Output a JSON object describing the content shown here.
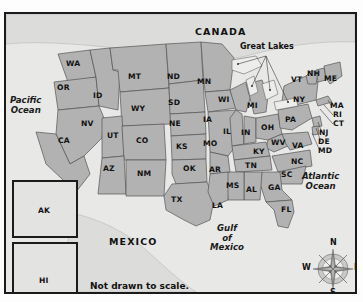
{
  "figure": {
    "note": "Not drawn to scale.",
    "background_color": "#e8e8e6",
    "land_fill_color": "#b2b2b2",
    "water_fill_color": "#ededeb",
    "border_color": "#1b1b1b",
    "outline_color": "#4a4a4a"
  },
  "countries": [
    {
      "name": "CANADA",
      "x": 199,
      "y": 22
    },
    {
      "name": "MEXICO",
      "x": 113,
      "y": 232
    }
  ],
  "oceans": [
    {
      "name": "Pacific\nOcean",
      "line1": "Pacific",
      "line2": "Ocean",
      "x": 8,
      "y": 92
    },
    {
      "name": "Atlantic\nOcean",
      "line1": "Atlantic",
      "line2": "Ocean",
      "x": 305,
      "y": 168
    }
  ],
  "gulf": {
    "line1": "Gulf",
    "line2": "of",
    "line3": "Mexico",
    "x": 212,
    "y": 222
  },
  "callouts": [
    {
      "label": "Great Lakes",
      "x": 241,
      "y": 38
    }
  ],
  "compass": {
    "north": "N",
    "south": "S",
    "east": "E",
    "west": "W",
    "center_x": 327,
    "center_y": 259
  },
  "insets": [
    {
      "label": "AK",
      "x": 7,
      "y": 175,
      "w": 64,
      "h": 56
    },
    {
      "label": "HI",
      "x": 7,
      "y": 235,
      "w": 64,
      "h": 52
    }
  ],
  "states": [
    {
      "code": "WA",
      "name": "Washington",
      "x": 66,
      "y": 50
    },
    {
      "code": "OR",
      "name": "Oregon",
      "x": 57,
      "y": 74
    },
    {
      "code": "ID",
      "name": "Idaho",
      "x": 93,
      "y": 82
    },
    {
      "code": "MT",
      "name": "Montana",
      "x": 128,
      "y": 63
    },
    {
      "code": "ND",
      "name": "North Dakota",
      "x": 167,
      "y": 63
    },
    {
      "code": "MN",
      "name": "Minnesota",
      "x": 197,
      "y": 68
    },
    {
      "code": "WI",
      "name": "Wisconsin",
      "x": 218,
      "y": 86
    },
    {
      "code": "MI",
      "name": "Michigan",
      "x": 247,
      "y": 92
    },
    {
      "code": "SD",
      "name": "South Dakota",
      "x": 168,
      "y": 89
    },
    {
      "code": "WY",
      "name": "Wyoming",
      "x": 131,
      "y": 95
    },
    {
      "code": "NV",
      "name": "Nevada",
      "x": 81,
      "y": 110
    },
    {
      "code": "CA",
      "name": "California",
      "x": 58,
      "y": 127
    },
    {
      "code": "UT",
      "name": "Utah",
      "x": 107,
      "y": 122
    },
    {
      "code": "CO",
      "name": "Colorado",
      "x": 136,
      "y": 127
    },
    {
      "code": "NE",
      "name": "Nebraska",
      "x": 169,
      "y": 110
    },
    {
      "code": "IA",
      "name": "Iowa",
      "x": 203,
      "y": 106
    },
    {
      "code": "IL",
      "name": "Illinois",
      "x": 223,
      "y": 118
    },
    {
      "code": "IN",
      "name": "Indiana",
      "x": 241,
      "y": 119
    },
    {
      "code": "OH",
      "name": "Ohio",
      "x": 261,
      "y": 114
    },
    {
      "code": "PA",
      "name": "Pennsylvania",
      "x": 285,
      "y": 106
    },
    {
      "code": "NY",
      "name": "New York",
      "x": 293,
      "y": 86
    },
    {
      "code": "VT",
      "name": "Vermont",
      "x": 291,
      "y": 66
    },
    {
      "code": "NH",
      "name": "New Hampshire",
      "x": 307,
      "y": 60
    },
    {
      "code": "ME",
      "name": "Maine",
      "x": 324,
      "y": 65
    },
    {
      "code": "MA",
      "name": "Massachusetts",
      "x": 330,
      "y": 92
    },
    {
      "code": "RI",
      "name": "Rhode Island",
      "x": 333,
      "y": 101
    },
    {
      "code": "CT",
      "name": "Connecticut",
      "x": 333,
      "y": 110
    },
    {
      "code": "NJ",
      "name": "New Jersey",
      "x": 319,
      "y": 119
    },
    {
      "code": "DE",
      "name": "Delaware",
      "x": 318,
      "y": 128
    },
    {
      "code": "MD",
      "name": "Maryland",
      "x": 318,
      "y": 137
    },
    {
      "code": "WV",
      "name": "West Virginia",
      "x": 271,
      "y": 129
    },
    {
      "code": "VA",
      "name": "Virginia",
      "x": 292,
      "y": 132
    },
    {
      "code": "KY",
      "name": "Kentucky",
      "x": 253,
      "y": 138
    },
    {
      "code": "NC",
      "name": "North Carolina",
      "x": 291,
      "y": 148
    },
    {
      "code": "TN",
      "name": "Tennessee",
      "x": 245,
      "y": 152
    },
    {
      "code": "SC",
      "name": "South Carolina",
      "x": 281,
      "y": 161
    },
    {
      "code": "GA",
      "name": "Georgia",
      "x": 268,
      "y": 174
    },
    {
      "code": "AL",
      "name": "Alabama",
      "x": 246,
      "y": 176
    },
    {
      "code": "MS",
      "name": "Mississippi",
      "x": 226,
      "y": 172
    },
    {
      "code": "AR",
      "name": "Arkansas",
      "x": 209,
      "y": 156
    },
    {
      "code": "MO",
      "name": "Missouri",
      "x": 203,
      "y": 130
    },
    {
      "code": "KS",
      "name": "Kansas",
      "x": 176,
      "y": 133
    },
    {
      "code": "OK",
      "name": "Oklahoma",
      "x": 183,
      "y": 155
    },
    {
      "code": "TX",
      "name": "Texas",
      "x": 171,
      "y": 186
    },
    {
      "code": "LA",
      "name": "Louisiana",
      "x": 212,
      "y": 192
    },
    {
      "code": "NM",
      "name": "New Mexico",
      "x": 137,
      "y": 160
    },
    {
      "code": "AZ",
      "name": "Arizona",
      "x": 103,
      "y": 155
    },
    {
      "code": "FL",
      "name": "Florida",
      "x": 281,
      "y": 196
    }
  ]
}
